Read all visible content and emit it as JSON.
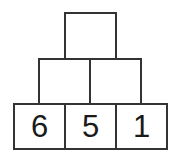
{
  "diagram": {
    "type": "number-pyramid",
    "rows": [
      {
        "row": "top",
        "cells": [
          {
            "value": ""
          }
        ]
      },
      {
        "row": "middle",
        "cells": [
          {
            "value": ""
          },
          {
            "value": ""
          }
        ]
      },
      {
        "row": "bottom",
        "cells": [
          {
            "value": "6"
          },
          {
            "value": "5"
          },
          {
            "value": "1"
          }
        ]
      }
    ],
    "colors": {
      "border": "#333333",
      "background": "#ffffff",
      "text": "#1a1a1a"
    }
  }
}
